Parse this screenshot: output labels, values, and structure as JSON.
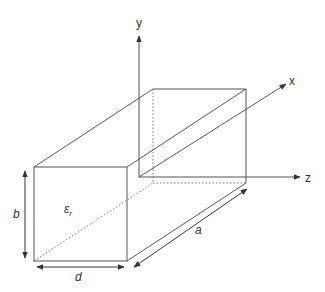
{
  "diagram": {
    "colors": {
      "line": "#555555",
      "text": "#333333",
      "background": "#ffffff"
    },
    "axes": {
      "y": {
        "label": "y"
      },
      "x": {
        "label": "x"
      },
      "z": {
        "label": "z"
      }
    },
    "dimensions": {
      "height": {
        "label": "b"
      },
      "width": {
        "label": "d"
      },
      "length": {
        "label": "a"
      }
    },
    "material": {
      "symbol": "ε",
      "subscript": "r"
    }
  }
}
